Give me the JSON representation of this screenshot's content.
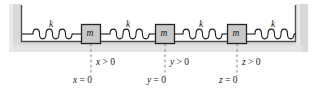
{
  "figure": {
    "background_color": "#ffffff",
    "wall_fill": "#d8d8d8",
    "wall_line_color": "#6e6e6e",
    "floor_band_fill": "#dcdcdc",
    "line_color": "#1a1a1a",
    "mass_fill": "#c9c9c9",
    "spring_color": "#1a1a1a",
    "dashed_color": "#7a7a7a"
  },
  "springs": [
    {
      "id": "spring-1",
      "label": "k",
      "coils": 5
    },
    {
      "id": "spring-2",
      "label": "k",
      "coils": 5
    },
    {
      "id": "spring-3",
      "label": "k",
      "coils": 5
    },
    {
      "id": "spring-4",
      "label": "k",
      "coils": 5
    }
  ],
  "masses": [
    {
      "id": "mass-1",
      "label": "m"
    },
    {
      "id": "mass-2",
      "label": "m"
    },
    {
      "id": "mass-3",
      "label": "m"
    }
  ],
  "coordinates": [
    {
      "id": "coordinate-x",
      "variable": "x",
      "inequality_var": "x",
      "inequality_rest": " > 0",
      "equality_var": "x",
      "equality_rest": " = 0"
    },
    {
      "id": "coordinate-y",
      "variable": "y",
      "inequality_var": "y",
      "inequality_rest": " > 0",
      "equality_var": "y",
      "equality_rest": " = 0"
    },
    {
      "id": "coordinate-z",
      "variable": "z",
      "inequality_var": "z",
      "inequality_rest": " > 0",
      "equality_var": "z",
      "equality_rest": " = 0"
    }
  ]
}
